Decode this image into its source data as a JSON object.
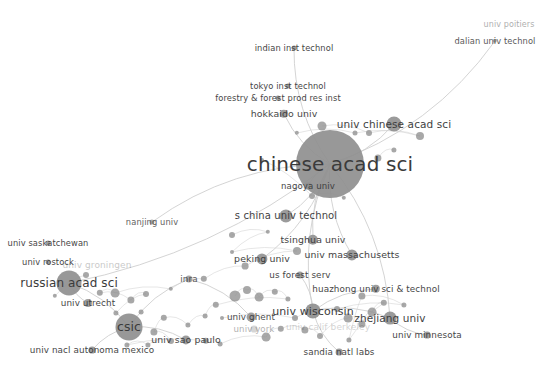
{
  "view": {
    "title": "bibliometric co-authorship network map",
    "background_color": "#ffffff",
    "width": 545,
    "height": 373,
    "node_color": "#8f8f8f",
    "edge_color": "#cfcfcf",
    "label_color": "#3b3b3b"
  },
  "chart_data": {
    "type": "scatter",
    "title": "",
    "xlabel": "",
    "ylabel": "",
    "xlim": [
      0,
      545
    ],
    "ylim": [
      0,
      373
    ],
    "grid": false,
    "legend": "none",
    "nodes": [
      {
        "label": "univ poitiers",
        "x": 509,
        "y": 25,
        "r": 0,
        "font": 8.0,
        "opacity": 0.42,
        "label_dx": 0,
        "label_dy": 0
      },
      {
        "label": "dalian univ technol",
        "x": 495,
        "y": 41,
        "r": 2.2,
        "font": 8.3,
        "opacity": 0.85,
        "label_dx": 0,
        "label_dy": 0
      },
      {
        "label": "indian inst technol",
        "x": 294,
        "y": 48,
        "r": 2.4,
        "font": 8.3,
        "opacity": 0.95,
        "label_dx": 0,
        "label_dy": 0
      },
      {
        "label": "tokyo inst technol",
        "x": 288,
        "y": 86,
        "r": 2.6,
        "font": 8.3,
        "opacity": 0.95,
        "label_dx": 0,
        "label_dy": 0
      },
      {
        "label": "forestry & forest prod res inst",
        "x": 278,
        "y": 98,
        "r": 2.6,
        "font": 8.3,
        "opacity": 0.95,
        "label_dx": 0,
        "label_dy": 0
      },
      {
        "label": "hokkaido univ",
        "x": 284,
        "y": 114,
        "r": 4.2,
        "font": 9.4,
        "opacity": 0.95,
        "label_dx": 0,
        "label_dy": 0
      },
      {
        "label": "univ chinese acad sci",
        "x": 394,
        "y": 124,
        "r": 7.5,
        "font": 10.5,
        "opacity": 0.97,
        "label_dx": 0,
        "label_dy": 0
      },
      {
        "label": "chinese acad sci",
        "x": 330,
        "y": 164,
        "r": 34.0,
        "font": 20.0,
        "opacity": 1.0,
        "label_dx": 0,
        "label_dy": 0
      },
      {
        "label": "nagoya univ",
        "x": 308,
        "y": 186,
        "r": 3.4,
        "font": 8.6,
        "opacity": 0.95,
        "label_dx": 0,
        "label_dy": 0
      },
      {
        "label": "nanjing univ",
        "x": 152,
        "y": 222,
        "r": 2.6,
        "font": 8.3,
        "opacity": 0.82,
        "label_dx": 0,
        "label_dy": 0
      },
      {
        "label": "s china univ technol",
        "x": 286,
        "y": 216,
        "r": 6.6,
        "font": 10.0,
        "opacity": 0.97,
        "label_dx": 0,
        "label_dy": 0
      },
      {
        "label": "tsinghua univ",
        "x": 313,
        "y": 240,
        "r": 5.2,
        "font": 9.4,
        "opacity": 0.97,
        "label_dx": 0,
        "label_dy": 0
      },
      {
        "label": "univ massachusetts",
        "x": 352,
        "y": 255,
        "r": 5.6,
        "font": 9.4,
        "opacity": 0.97,
        "label_dx": 0,
        "label_dy": 0
      },
      {
        "label": "peking univ",
        "x": 262,
        "y": 259,
        "r": 5.6,
        "font": 9.4,
        "opacity": 0.97,
        "label_dx": 0,
        "label_dy": 0
      },
      {
        "label": "us forest serv",
        "x": 300,
        "y": 275,
        "r": 3.6,
        "font": 8.8,
        "opacity": 0.95,
        "label_dx": 0,
        "label_dy": 0
      },
      {
        "label": "huazhong univ sci & technol",
        "x": 376,
        "y": 289,
        "r": 4.2,
        "font": 8.8,
        "opacity": 0.95,
        "label_dx": 0,
        "label_dy": 0
      },
      {
        "label": "univ saskatchewan",
        "x": 48,
        "y": 243,
        "r": 2.4,
        "font": 8.3,
        "opacity": 0.95,
        "label_dx": 0,
        "label_dy": 0
      },
      {
        "label": "univ rostock",
        "x": 48,
        "y": 262,
        "r": 2.4,
        "font": 8.3,
        "opacity": 0.95,
        "label_dx": 0,
        "label_dy": 0
      },
      {
        "label": "univ groningen",
        "x": 97,
        "y": 265,
        "r": 0,
        "font": 9.0,
        "opacity": 0.28,
        "label_dx": 0,
        "label_dy": 0
      },
      {
        "label": "russian acad sci",
        "x": 69,
        "y": 283,
        "r": 12.5,
        "font": 12.0,
        "opacity": 1.0,
        "label_dx": 0,
        "label_dy": 0
      },
      {
        "label": "univ utrecht",
        "x": 88,
        "y": 303,
        "r": 4.0,
        "font": 8.8,
        "opacity": 0.95,
        "label_dx": 0,
        "label_dy": 0
      },
      {
        "label": "inra",
        "x": 189,
        "y": 279,
        "r": 3.6,
        "font": 8.8,
        "opacity": 0.85,
        "label_dx": 0,
        "label_dy": 0
      },
      {
        "label": "univ wisconsin",
        "x": 313,
        "y": 311,
        "r": 7.6,
        "font": 11.0,
        "opacity": 1.0,
        "label_dx": 0,
        "label_dy": 0
      },
      {
        "label": "zhejiang univ",
        "x": 390,
        "y": 318,
        "r": 6.4,
        "font": 10.5,
        "opacity": 0.97,
        "label_dx": 0,
        "label_dy": 0
      },
      {
        "label": "univ minnesota",
        "x": 427,
        "y": 335,
        "r": 3.4,
        "font": 8.8,
        "opacity": 0.95,
        "label_dx": 0,
        "label_dy": 0
      },
      {
        "label": "univ ghent",
        "x": 251,
        "y": 317,
        "r": 4.4,
        "font": 8.8,
        "opacity": 0.92,
        "label_dx": 0,
        "label_dy": 0
      },
      {
        "label": "univ york",
        "x": 254,
        "y": 329,
        "r": 3.4,
        "font": 8.6,
        "opacity": 0.4,
        "label_dx": 0,
        "label_dy": 0
      },
      {
        "label": "univ calif berkeley",
        "x": 328,
        "y": 327,
        "r": 0,
        "font": 9.0,
        "opacity": 0.22,
        "label_dx": 0,
        "label_dy": 0
      },
      {
        "label": "csic",
        "x": 129,
        "y": 327,
        "r": 13.5,
        "font": 12.5,
        "opacity": 1.0,
        "label_dx": 0,
        "label_dy": 0
      },
      {
        "label": "univ sao paulo",
        "x": 186,
        "y": 340,
        "r": 4.6,
        "font": 9.4,
        "opacity": 0.95,
        "label_dx": 0,
        "label_dy": 0
      },
      {
        "label": "univ nacl autonoma mexico",
        "x": 92,
        "y": 350,
        "r": 3.4,
        "font": 8.8,
        "opacity": 0.95,
        "label_dx": 0,
        "label_dy": 0
      },
      {
        "label": "sandia natl labs",
        "x": 339,
        "y": 352,
        "r": 3.4,
        "font": 8.8,
        "opacity": 0.95,
        "label_dx": 0,
        "label_dy": 0
      }
    ],
    "unlabeled_nodes": [
      {
        "x": 322,
        "y": 126,
        "r": 4.5
      },
      {
        "x": 369,
        "y": 133,
        "r": 3.0
      },
      {
        "x": 420,
        "y": 136,
        "r": 4.0
      },
      {
        "x": 355,
        "y": 133,
        "r": 2.5
      },
      {
        "x": 297,
        "y": 133,
        "r": 2.2
      },
      {
        "x": 378,
        "y": 158,
        "r": 3.6
      },
      {
        "x": 394,
        "y": 150,
        "r": 2.6
      },
      {
        "x": 262,
        "y": 160,
        "r": 2.0
      },
      {
        "x": 312,
        "y": 196,
        "r": 3.0
      },
      {
        "x": 344,
        "y": 198,
        "r": 2.2
      },
      {
        "x": 232,
        "y": 235,
        "r": 3.0
      },
      {
        "x": 268,
        "y": 232,
        "r": 2.2
      },
      {
        "x": 232,
        "y": 252,
        "r": 2.0
      },
      {
        "x": 297,
        "y": 251,
        "r": 4.0
      },
      {
        "x": 245,
        "y": 266,
        "r": 3.4
      },
      {
        "x": 204,
        "y": 279,
        "r": 3.2
      },
      {
        "x": 171,
        "y": 289,
        "r": 2.2
      },
      {
        "x": 115,
        "y": 293,
        "r": 4.4
      },
      {
        "x": 100,
        "y": 293,
        "r": 3.2
      },
      {
        "x": 131,
        "y": 300,
        "r": 3.6
      },
      {
        "x": 146,
        "y": 294,
        "r": 3.0
      },
      {
        "x": 116,
        "y": 313,
        "r": 2.6
      },
      {
        "x": 235,
        "y": 296,
        "r": 5.5
      },
      {
        "x": 247,
        "y": 290,
        "r": 4.0
      },
      {
        "x": 259,
        "y": 297,
        "r": 4.4
      },
      {
        "x": 275,
        "y": 292,
        "r": 3.2
      },
      {
        "x": 288,
        "y": 299,
        "r": 2.6
      },
      {
        "x": 216,
        "y": 305,
        "r": 3.2
      },
      {
        "x": 205,
        "y": 316,
        "r": 2.4
      },
      {
        "x": 188,
        "y": 325,
        "r": 2.6
      },
      {
        "x": 164,
        "y": 318,
        "r": 3.2
      },
      {
        "x": 154,
        "y": 332,
        "r": 3.6
      },
      {
        "x": 171,
        "y": 341,
        "r": 3.0
      },
      {
        "x": 148,
        "y": 345,
        "r": 2.6
      },
      {
        "x": 127,
        "y": 345,
        "r": 2.6
      },
      {
        "x": 206,
        "y": 341,
        "r": 3.2
      },
      {
        "x": 220,
        "y": 344,
        "r": 2.4
      },
      {
        "x": 266,
        "y": 337,
        "r": 4.4
      },
      {
        "x": 281,
        "y": 329,
        "r": 3.2
      },
      {
        "x": 305,
        "y": 330,
        "r": 3.6
      },
      {
        "x": 320,
        "y": 336,
        "r": 3.0
      },
      {
        "x": 348,
        "y": 318,
        "r": 4.4
      },
      {
        "x": 362,
        "y": 324,
        "r": 3.6
      },
      {
        "x": 372,
        "y": 312,
        "r": 4.4
      },
      {
        "x": 384,
        "y": 303,
        "r": 3.2
      },
      {
        "x": 349,
        "y": 340,
        "r": 2.6
      },
      {
        "x": 362,
        "y": 296,
        "r": 3.6
      },
      {
        "x": 404,
        "y": 305,
        "r": 2.6
      },
      {
        "x": 337,
        "y": 309,
        "r": 3.0
      },
      {
        "x": 295,
        "y": 318,
        "r": 3.0
      },
      {
        "x": 222,
        "y": 318,
        "r": 2.0
      },
      {
        "x": 86,
        "y": 275,
        "r": 3.0
      },
      {
        "x": 55,
        "y": 296,
        "r": 2.2
      },
      {
        "x": 141,
        "y": 312,
        "r": 2.4
      }
    ],
    "edges": [
      [
        "chinese acad sci",
        "univ chinese acad sci"
      ],
      [
        "chinese acad sci",
        "hokkaido univ"
      ],
      [
        "chinese acad sci",
        "nagoya univ"
      ],
      [
        "chinese acad sci",
        "s china univ technol"
      ],
      [
        "chinese acad sci",
        "tsinghua univ"
      ],
      [
        "chinese acad sci",
        "peking univ"
      ],
      [
        "chinese acad sci",
        "dalian univ technol"
      ],
      [
        "chinese acad sci",
        "indian inst technol"
      ],
      [
        "chinese acad sci",
        "univ massachusetts"
      ],
      [
        "chinese acad sci",
        "zhejiang univ"
      ],
      [
        "chinese acad sci",
        "univ wisconsin"
      ],
      [
        "chinese acad sci",
        "russian acad sci"
      ],
      [
        "chinese acad sci",
        "nanjing univ"
      ],
      [
        "russian acad sci",
        "csic"
      ],
      [
        "russian acad sci",
        "univ utrecht"
      ],
      [
        "csic",
        "univ sao paulo"
      ],
      [
        "csic",
        "univ nacl autonoma mexico"
      ],
      [
        "csic",
        "inra"
      ],
      [
        "univ wisconsin",
        "us forest serv"
      ],
      [
        "univ wisconsin",
        "huazhong univ sci & technol"
      ],
      [
        "univ wisconsin",
        "sandia natl labs"
      ],
      [
        "univ wisconsin",
        "zhejiang univ"
      ],
      [
        "zhejiang univ",
        "univ minnesota"
      ],
      [
        "inra",
        "univ ghent"
      ]
    ]
  }
}
